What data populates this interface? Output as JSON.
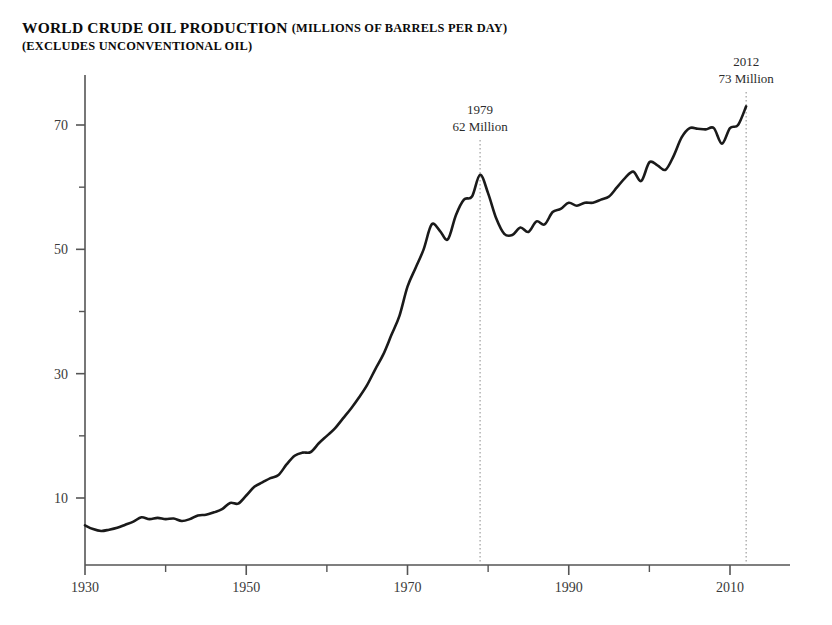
{
  "header": {
    "title_main": "WORLD CRUDE OIL PRODUCTION",
    "title_units": "(MILLIONS OF BARRELS PER DAY)",
    "title_line2": "(EXCLUDES UNCONVENTIONAL OIL)"
  },
  "annotations": [
    {
      "name": "annotation-1979",
      "year_label": "1979",
      "value_label": "62 Million",
      "x_year": 1979,
      "y_value": 62
    },
    {
      "name": "annotation-2012",
      "year_label": "2012",
      "value_label": "73 Million",
      "x_year": 2012,
      "y_value": 73
    }
  ],
  "colors": {
    "line": "#1a1a1a",
    "axis": "#555555",
    "annotation_rule": "#8a8a8a",
    "text": "#2b2b2b",
    "background": "#ffffff"
  },
  "chart_data": {
    "type": "line",
    "subtitle": "(EXCLUDES UNCONVENTIONAL OIL)",
    "xlabel": "",
    "ylabel": "",
    "xlim": [
      1930,
      2022
    ],
    "ylim": [
      0,
      78
    ],
    "grid": false,
    "legend": "none",
    "x_ticks_major": [
      1930,
      1950,
      1970,
      1990,
      2010
    ],
    "x_ticks_minor": [
      1940,
      1960,
      1980,
      2000,
      2020
    ],
    "y_ticks_major": [
      10,
      30,
      50,
      70
    ],
    "y_ticks_minor": [
      20,
      40,
      60
    ],
    "series": [
      {
        "name": "World crude oil production",
        "units": "millions of barrels per day",
        "x": [
          1930,
          1931,
          1932,
          1933,
          1934,
          1935,
          1936,
          1937,
          1938,
          1939,
          1940,
          1941,
          1942,
          1943,
          1944,
          1945,
          1946,
          1947,
          1948,
          1949,
          1950,
          1951,
          1952,
          1953,
          1954,
          1955,
          1956,
          1957,
          1958,
          1959,
          1960,
          1961,
          1962,
          1963,
          1964,
          1965,
          1966,
          1967,
          1968,
          1969,
          1970,
          1971,
          1972,
          1973,
          1974,
          1975,
          1976,
          1977,
          1978,
          1979,
          1980,
          1981,
          1982,
          1983,
          1984,
          1985,
          1986,
          1987,
          1988,
          1989,
          1990,
          1991,
          1992,
          1993,
          1994,
          1995,
          1996,
          1997,
          1998,
          1999,
          2000,
          2001,
          2002,
          2003,
          2004,
          2005,
          2006,
          2007,
          2008,
          2009,
          2010,
          2011,
          2012
        ],
        "values": [
          5.6,
          5.0,
          4.7,
          4.9,
          5.2,
          5.7,
          6.2,
          6.9,
          6.6,
          6.8,
          6.6,
          6.7,
          6.3,
          6.6,
          7.2,
          7.3,
          7.7,
          8.2,
          9.2,
          9.1,
          10.4,
          11.8,
          12.5,
          13.2,
          13.7,
          15.4,
          16.8,
          17.3,
          17.4,
          18.8,
          20.0,
          21.2,
          22.8,
          24.4,
          26.2,
          28.2,
          30.7,
          33.1,
          36.2,
          39.3,
          44.0,
          47.0,
          50.0,
          54.0,
          53.0,
          51.6,
          55.5,
          58.0,
          58.5,
          62.0,
          59.0,
          55.0,
          52.5,
          52.3,
          53.5,
          52.8,
          54.5,
          54.0,
          56.0,
          56.5,
          57.5,
          57.0,
          57.5,
          57.5,
          58.0,
          58.5,
          60.0,
          61.5,
          62.5,
          61.0,
          64.0,
          63.5,
          62.8,
          65.0,
          68.0,
          69.5,
          69.4,
          69.3,
          69.5,
          67.0,
          69.5,
          70.0,
          73.0
        ]
      }
    ]
  },
  "axes": {
    "y_tick_labels": [
      "10",
      "30",
      "50",
      "70"
    ],
    "x_tick_labels": [
      "1930",
      "1950",
      "1970",
      "1990",
      "2010"
    ]
  }
}
